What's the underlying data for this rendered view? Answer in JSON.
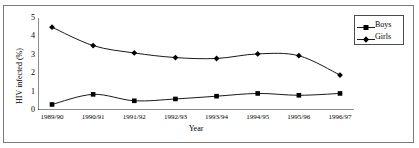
{
  "chart_data": {
    "type": "line",
    "title": "",
    "xlabel": "Year",
    "ylabel": "HIV infected (%)",
    "categories": [
      "1989/90",
      "1990/91",
      "1991/92",
      "1992/93",
      "1993/94",
      "1994/95",
      "1995/96",
      "1996/97"
    ],
    "ylim": [
      0,
      5
    ],
    "yticks": [
      0,
      1,
      2,
      3,
      4,
      5
    ],
    "ytick_labels": [
      "0",
      "1",
      "2",
      "3",
      "4",
      "5"
    ],
    "grid": false,
    "legend_position": "top-right",
    "series": [
      {
        "name": "Boys",
        "marker": "square",
        "color": "#000000",
        "values": [
          0.3,
          0.85,
          0.5,
          0.6,
          0.75,
          0.9,
          0.8,
          0.9
        ]
      },
      {
        "name": "Girls",
        "marker": "diamond",
        "color": "#000000",
        "values": [
          4.5,
          3.5,
          3.1,
          2.85,
          2.8,
          3.05,
          2.95,
          1.9
        ]
      }
    ]
  },
  "legend": {
    "entries": [
      {
        "label": "Boys"
      },
      {
        "label": "Girls"
      }
    ]
  },
  "axes": {
    "y_title": "HIV infected (%)",
    "x_title": "Year"
  }
}
